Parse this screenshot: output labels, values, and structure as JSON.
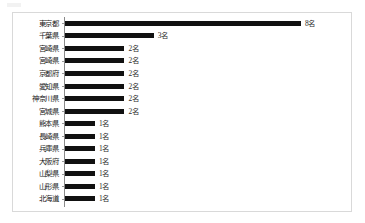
{
  "chart_data": {
    "type": "bar",
    "orientation": "horizontal",
    "title": "",
    "subtitle": "",
    "xlabel": "",
    "ylabel": "",
    "grid": false,
    "legend": null,
    "xlim": [
      0,
      8
    ],
    "value_suffix": "名",
    "categories": [
      "東京都",
      "千葉県",
      "宮崎県",
      "宮崎県",
      "京都府",
      "愛知県",
      "神奈川県",
      "宮城県",
      "熊本県",
      "長崎県",
      "兵庫県",
      "大阪府",
      "山梨県",
      "山形県",
      "北海道"
    ],
    "values": [
      8,
      3,
      2,
      2,
      2,
      2,
      2,
      2,
      1,
      1,
      1,
      1,
      1,
      1,
      1
    ],
    "data_labels": [
      "8名",
      "3名",
      "2名",
      "2名",
      "2名",
      "2名",
      "2名",
      "2名",
      "1名",
      "1名",
      "1名",
      "1名",
      "1名",
      "1名",
      "1名"
    ],
    "colors": {
      "bar": "#111111",
      "axis": "#8a8a8a",
      "frame_border": "#d9d9d9",
      "label_text": "#1a1a1a",
      "value_text": "#2b2b2b",
      "background": "#ffffff"
    }
  }
}
